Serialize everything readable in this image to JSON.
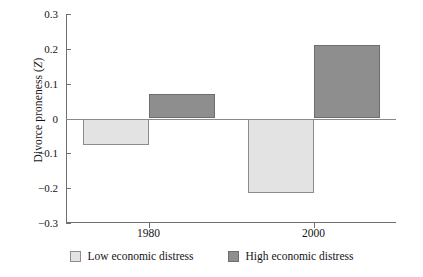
{
  "chart_data": {
    "type": "bar",
    "title": "",
    "xlabel": "",
    "ylabel": "Divorce proneness (Z)",
    "categories": [
      "1980",
      "2000"
    ],
    "series": [
      {
        "name": "Low economic distress",
        "values": [
          -0.075,
          -0.215
        ],
        "color": "#e3e3e3"
      },
      {
        "name": "High economic distress",
        "values": [
          0.07,
          0.212
        ],
        "color": "#8e8e8e"
      }
    ],
    "ylim": [
      -0.3,
      0.3
    ],
    "yticks": [
      "0.3",
      "0.2",
      "0.1",
      "0",
      "−0.1",
      "−0.2",
      "−0.3"
    ],
    "ytick_values": [
      0.3,
      0.2,
      0.1,
      0,
      -0.1,
      -0.2,
      -0.3
    ],
    "grid": false,
    "zero_line": true,
    "legend_position": "bottom"
  },
  "axes": {
    "y_title_main": "Divorce proneness (",
    "y_title_symbol": "Z",
    "y_title_close": ")"
  },
  "legend": {
    "items": [
      {
        "label": "Low economic distress",
        "swatch": "low"
      },
      {
        "label": "High economic distress",
        "swatch": "high"
      }
    ]
  }
}
